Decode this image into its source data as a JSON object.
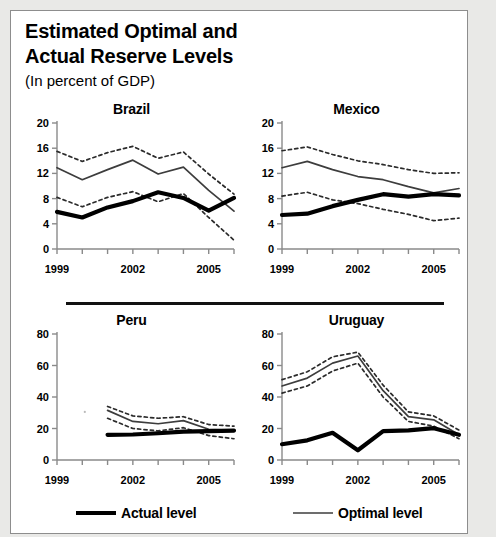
{
  "figure": {
    "title_line1": "Estimated Optimal and",
    "title_line2": "Actual Reserve Levels",
    "subtitle": "(In percent of GDP)",
    "footnote_partial": "Sources: Authors' calculations."
  },
  "legend": {
    "actual": "Actual level",
    "optimal": "Optimal level",
    "actual_color": "#000000",
    "optimal_color": "#3d3d3d"
  },
  "chart_data": [
    {
      "type": "line",
      "title": "Brazil",
      "xlabel": "",
      "ylabel": "",
      "xlim": [
        1999,
        2006
      ],
      "ylim": [
        0,
        20
      ],
      "xticks": [
        1999,
        2000,
        2001,
        2002,
        2003,
        2004,
        2005,
        2006
      ],
      "xticklabels": [
        "1999",
        "",
        "",
        "2002",
        "",
        "",
        "2005",
        ""
      ],
      "yticks": [
        0,
        4,
        8,
        12,
        16,
        20
      ],
      "grid": false,
      "x": [
        1999,
        2000,
        2001,
        2002,
        2003,
        2004,
        2005,
        2006
      ],
      "series": [
        {
          "name": "Actual level",
          "style": "thick-solid",
          "values": [
            5.9,
            5.0,
            6.6,
            7.6,
            9.0,
            8.1,
            6.1,
            8.1
          ]
        },
        {
          "name": "Optimal level",
          "style": "thin-solid",
          "values": [
            12.9,
            11.0,
            12.6,
            14.1,
            11.9,
            13.0,
            9.3,
            6.0
          ]
        },
        {
          "name": "Optimal upper band",
          "style": "dotted",
          "values": [
            15.5,
            13.9,
            15.3,
            16.3,
            14.4,
            15.4,
            11.9,
            8.7
          ]
        },
        {
          "name": "Optimal lower band",
          "style": "dotted",
          "values": [
            8.2,
            6.7,
            8.2,
            9.1,
            7.5,
            8.8,
            5.0,
            1.4
          ]
        }
      ]
    },
    {
      "type": "line",
      "title": "Mexico",
      "xlabel": "",
      "ylabel": "",
      "xlim": [
        1999,
        2006
      ],
      "ylim": [
        0,
        20
      ],
      "xticks": [
        1999,
        2000,
        2001,
        2002,
        2003,
        2004,
        2005,
        2006
      ],
      "xticklabels": [
        "1999",
        "",
        "",
        "2002",
        "",
        "",
        "2005",
        ""
      ],
      "yticks": [
        0,
        4,
        8,
        12,
        16,
        20
      ],
      "grid": false,
      "x": [
        1999,
        2000,
        2001,
        2002,
        2003,
        2004,
        2005,
        2006
      ],
      "series": [
        {
          "name": "Actual level",
          "style": "thick-solid",
          "values": [
            5.4,
            5.6,
            6.8,
            7.8,
            8.7,
            8.3,
            8.7,
            8.5
          ]
        },
        {
          "name": "Optimal level",
          "style": "thin-solid",
          "values": [
            12.9,
            13.9,
            12.6,
            11.5,
            11.0,
            9.9,
            8.9,
            9.6
          ]
        },
        {
          "name": "Optimal upper band",
          "style": "dotted",
          "values": [
            15.6,
            16.2,
            15.0,
            14.0,
            13.4,
            12.6,
            12.0,
            12.1
          ]
        },
        {
          "name": "Optimal lower band",
          "style": "dotted",
          "values": [
            8.4,
            9.0,
            7.8,
            7.2,
            6.3,
            5.5,
            4.5,
            4.9
          ]
        }
      ]
    },
    {
      "type": "line",
      "title": "Peru",
      "xlabel": "",
      "ylabel": "",
      "xlim": [
        1999,
        2006
      ],
      "ylim": [
        0,
        80
      ],
      "xticks": [
        1999,
        2000,
        2001,
        2002,
        2003,
        2004,
        2005,
        2006
      ],
      "xticklabels": [
        "1999",
        "",
        "",
        "2002",
        "",
        "",
        "2005",
        ""
      ],
      "yticks": [
        0,
        20,
        40,
        60,
        80
      ],
      "grid": false,
      "x": [
        2001,
        2002,
        2003,
        2004,
        2005,
        2006
      ],
      "series": [
        {
          "name": "Actual level",
          "style": "thick-solid",
          "values": [
            16.0,
            16.2,
            17.0,
            18.0,
            18.3,
            18.7
          ]
        },
        {
          "name": "Optimal level",
          "style": "thin-solid",
          "values": [
            31.5,
            24.5,
            23.0,
            25.0,
            19.5,
            18.8
          ]
        },
        {
          "name": "Optimal upper band",
          "style": "dotted",
          "values": [
            34.0,
            28.0,
            26.5,
            27.5,
            22.5,
            21.5
          ]
        },
        {
          "name": "Optimal lower band",
          "style": "dotted",
          "values": [
            26.5,
            20.0,
            18.5,
            20.5,
            15.5,
            13.5
          ]
        }
      ]
    },
    {
      "type": "line",
      "title": "Uruguay",
      "xlabel": "",
      "ylabel": "",
      "xlim": [
        1999,
        2006
      ],
      "ylim": [
        0,
        80
      ],
      "xticks": [
        1999,
        2000,
        2001,
        2002,
        2003,
        2004,
        2005,
        2006
      ],
      "xticklabels": [
        "1999",
        "",
        "",
        "2002",
        "",
        "",
        "2005",
        ""
      ],
      "yticks": [
        0,
        20,
        40,
        60,
        80
      ],
      "grid": false,
      "x": [
        1999,
        2000,
        2001,
        2002,
        2003,
        2004,
        2005,
        2006
      ],
      "series": [
        {
          "name": "Actual level",
          "style": "thick-solid",
          "values": [
            10.0,
            12.5,
            17.3,
            6.2,
            18.3,
            18.8,
            20.2,
            16.0
          ]
        },
        {
          "name": "Optimal level",
          "style": "thin-solid",
          "values": [
            47.0,
            52.0,
            61.5,
            66.0,
            44.0,
            27.5,
            25.5,
            16.0
          ]
        },
        {
          "name": "Optimal upper band",
          "style": "dotted",
          "values": [
            51.0,
            56.0,
            65.5,
            68.5,
            47.5,
            30.5,
            28.0,
            19.0
          ]
        },
        {
          "name": "Optimal lower band",
          "style": "dotted",
          "values": [
            42.5,
            47.0,
            56.5,
            61.5,
            40.0,
            24.5,
            21.5,
            13.5
          ]
        }
      ]
    }
  ]
}
